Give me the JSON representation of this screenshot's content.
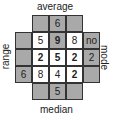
{
  "labels": {
    "top": "average",
    "bottom": "median",
    "left": "range",
    "right": "mode"
  },
  "grid": {
    "inner": [
      [
        {
          "v": "5",
          "bold": false,
          "gray": false
        },
        {
          "v": "9",
          "bold": true,
          "gray": true
        },
        {
          "v": "8",
          "bold": false,
          "gray": false
        }
      ],
      [
        {
          "v": "2",
          "bold": true,
          "gray": false
        },
        {
          "v": "5",
          "bold": true,
          "gray": false
        },
        {
          "v": "2",
          "bold": true,
          "gray": false
        }
      ],
      [
        {
          "v": "8",
          "bold": false,
          "gray": false
        },
        {
          "v": "4",
          "bold": false,
          "gray": false
        },
        {
          "v": "2",
          "bold": true,
          "gray": false
        }
      ]
    ],
    "average_row": [
      "",
      "6",
      ""
    ],
    "median_row": [
      "",
      "5",
      ""
    ],
    "range_col": [
      "",
      "",
      "6"
    ],
    "mode_col": [
      "no",
      "2",
      ""
    ]
  },
  "colors": {
    "gray": "#a9a9a9",
    "border": "#333333"
  }
}
